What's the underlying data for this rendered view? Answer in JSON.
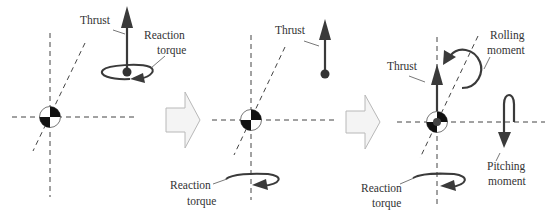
{
  "figure": {
    "colors": {
      "arrow": "#3a3a3a",
      "dashed_axis": "#444444",
      "text": "#333333",
      "transition_arrow_fill": "#f4f4f4",
      "transition_arrow_stroke": "#b8b8b8"
    }
  },
  "panels": [
    {
      "id": 1,
      "labels": {
        "thrust": "Thrust",
        "reaction_line1": "Reaction",
        "reaction_line2": "torque"
      }
    },
    {
      "id": 2,
      "labels": {
        "thrust": "Thrust",
        "reaction_line1": "Reaction",
        "reaction_line2": "torque"
      }
    },
    {
      "id": 3,
      "labels": {
        "thrust": "Thrust",
        "rolling_line1": "Rolling",
        "rolling_line2": "moment",
        "pitching_line1": "Pitching",
        "pitching_line2": "moment",
        "reaction_line1": "Reaction",
        "reaction_line2": "torque"
      }
    }
  ],
  "icons": {
    "cg": "center-of-gravity-symbol",
    "transition": "block-arrow-right"
  }
}
